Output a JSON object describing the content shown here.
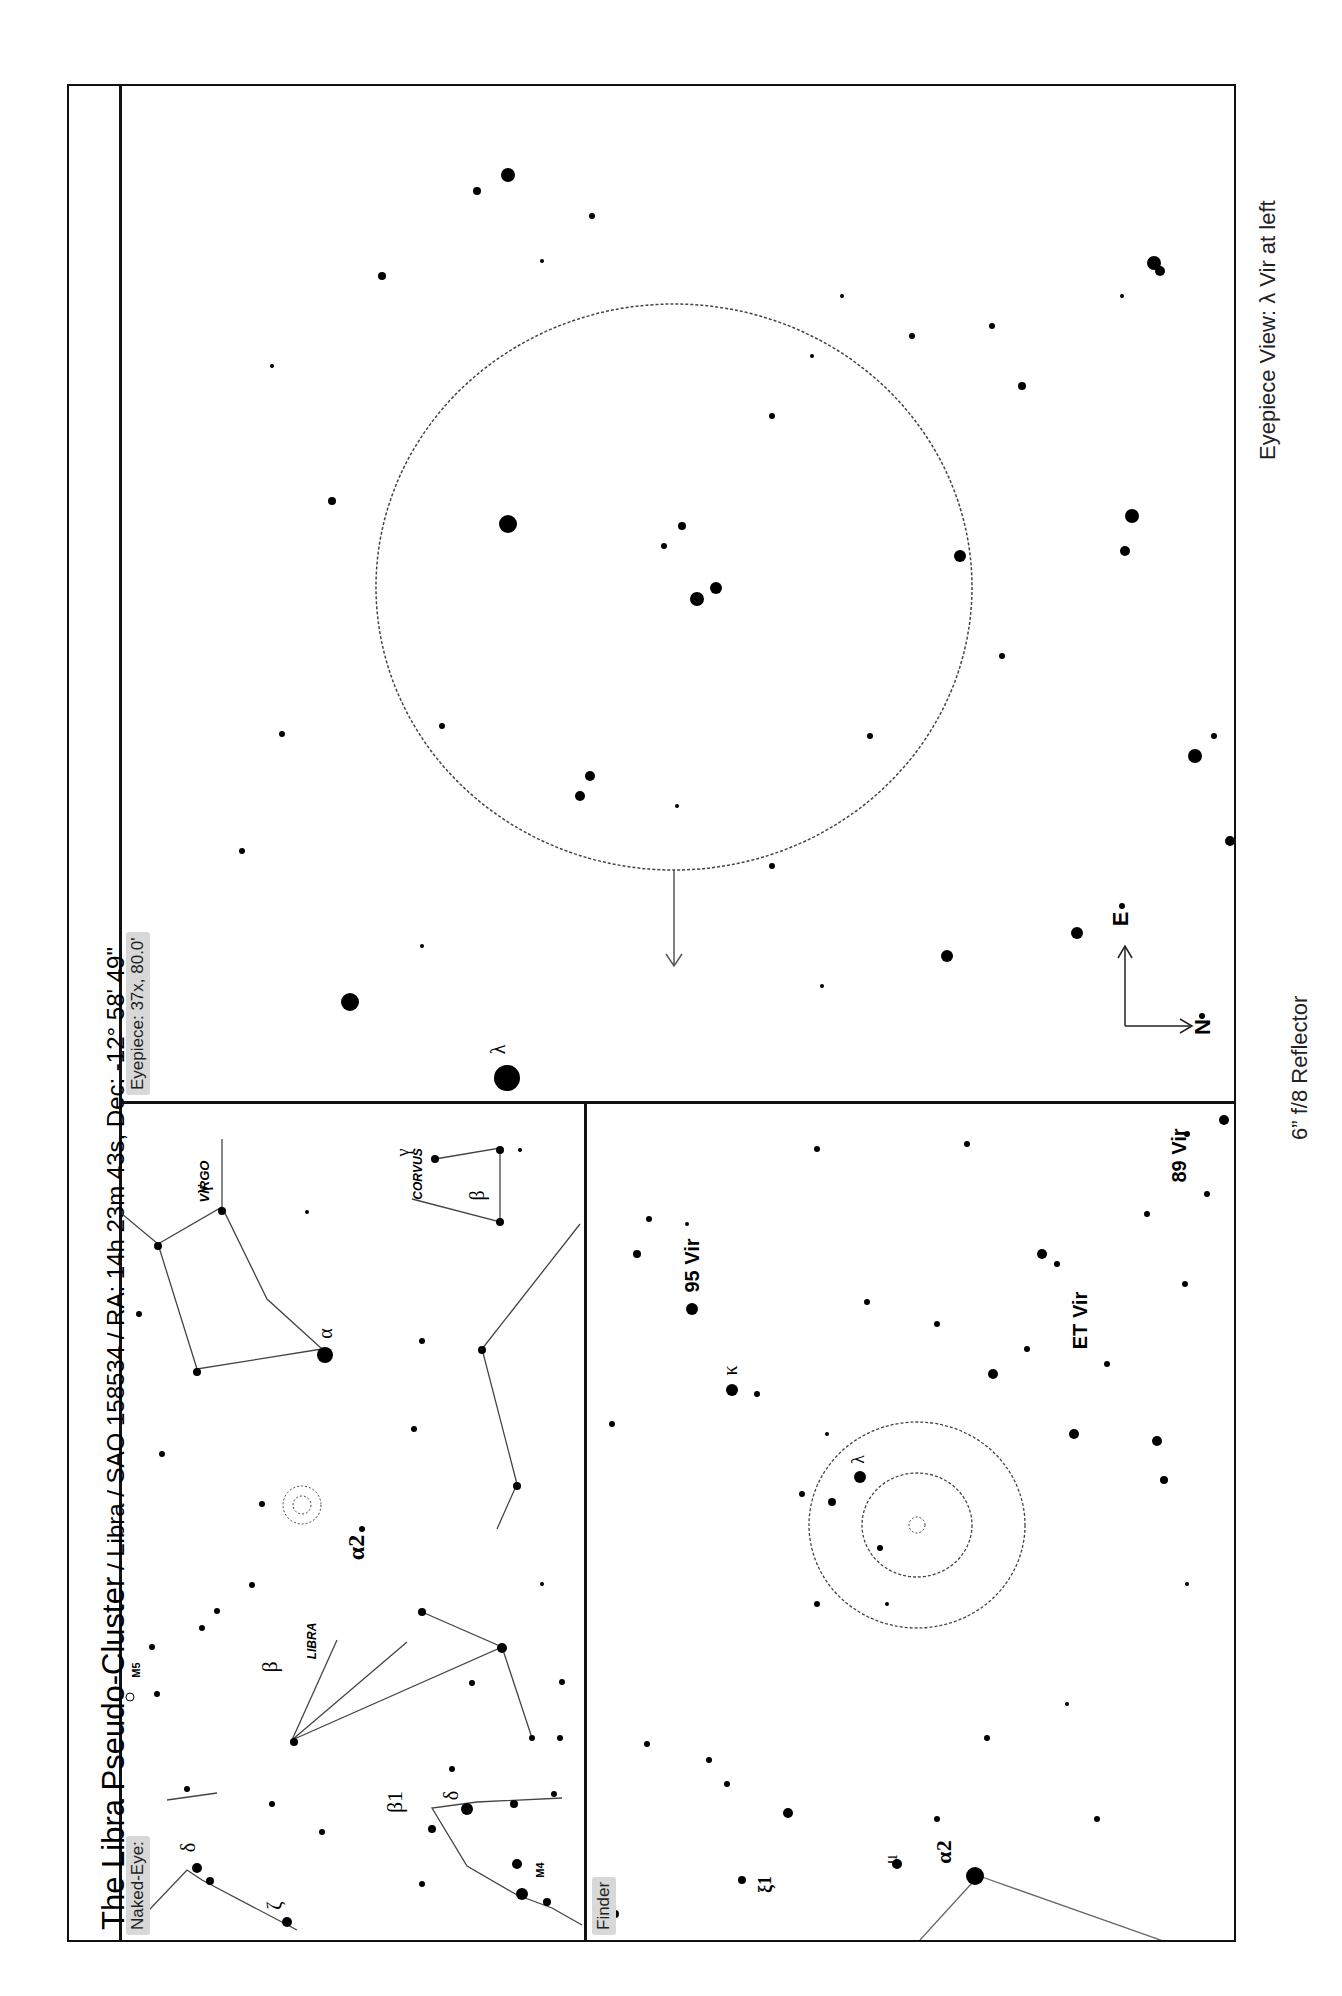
{
  "title": {
    "main": "The Libra Pseudo-Cluster",
    "details": " / Libra / SAO 158534 / RA: 14h 23m 43s, Dec: -12° 58' 49\""
  },
  "panels": {
    "eyepiece": {
      "tag": "Eyepiece: 37x, 80.0'",
      "star_label": "λ",
      "compass": {
        "east": "E",
        "north": "N"
      }
    },
    "naked_eye": {
      "tag": "Naked-Eye:",
      "labels": {
        "virgo": "VIRGO",
        "corvus": "CORVUS",
        "libra": "LIBRA",
        "alpha": "α",
        "alpha2": "α2",
        "beta": "β",
        "beta_corvus": "β",
        "gamma": "γ",
        "gamma_corvus": "γ",
        "beta1": "β1",
        "delta": "δ",
        "delta2": "δ",
        "zeta": "ζ",
        "m5": "M5",
        "m4": "M4"
      }
    },
    "finder": {
      "tag": "Finder",
      "labels": {
        "vir95": "95 Vir",
        "vir89": "89 Vir",
        "et_vir": "ET Vir",
        "kappa": "κ",
        "lambda": "λ",
        "mu": "μ",
        "xi1": "ξ1",
        "alpha2": "α2"
      }
    }
  },
  "captions": {
    "eyepiece_view": "Eyepiece View: λ Vir at left",
    "telescope": "6” f/8 Reflector"
  }
}
